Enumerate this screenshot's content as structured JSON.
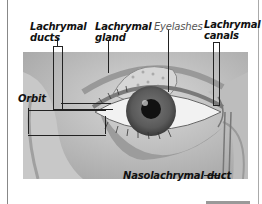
{
  "diagram": {
    "labels": {
      "lachrymal_ducts": "Lachrymal ducts",
      "lachrymal_ducts_l1": "Lachrymal",
      "lachrymal_ducts_l2": "ducts",
      "lachrymal_gland_l1": "Lachrymal",
      "lachrymal_gland_l2": "gland",
      "eyelashes": "Eyelashes",
      "lachrymal_canals_l1": "Lachrymal",
      "lachrymal_canals_l2": "canals",
      "orbit": "Orbit",
      "nasolachrymal_duct": "Nasolachrymal duct"
    },
    "colors": {
      "label_text": "#111111",
      "light_label_text": "#555555",
      "leader_lines": "#222222",
      "background": "#ffffff"
    }
  }
}
